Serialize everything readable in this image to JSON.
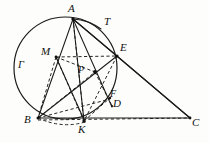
{
  "figure": {
    "background_color": "#fdfdfb",
    "stroke_color": "#1a1a18",
    "dashed_color": "#262624"
  },
  "labels": {
    "A": "A",
    "T": "T",
    "E": "E",
    "M": "M",
    "Gamma": "Γ",
    "P": "P",
    "F": "F",
    "D": "D",
    "B": "B",
    "K": "K",
    "C": "C"
  },
  "label_positions": {
    "A": {
      "x": 68,
      "y": 3
    },
    "T": {
      "x": 104,
      "y": 16
    },
    "E": {
      "x": 120,
      "y": 42
    },
    "M": {
      "x": 41,
      "y": 46
    },
    "Gamma": {
      "x": 18,
      "y": 60
    },
    "P": {
      "x": 78,
      "y": 65
    },
    "F": {
      "x": 110,
      "y": 90
    },
    "D": {
      "x": 113,
      "y": 99
    },
    "B": {
      "x": 24,
      "y": 115
    },
    "K": {
      "x": 78,
      "y": 124
    },
    "C": {
      "x": 192,
      "y": 118
    }
  },
  "points": {
    "A": {
      "x": 73,
      "y": 19
    },
    "T": {
      "x": 99,
      "y": 26
    },
    "E": {
      "x": 117,
      "y": 56
    },
    "M": {
      "x": 56,
      "y": 57
    },
    "P": {
      "x": 95,
      "y": 72
    },
    "F": {
      "x": 109,
      "y": 98
    },
    "D": {
      "x": 112,
      "y": 106
    },
    "B": {
      "x": 38,
      "y": 118
    },
    "K": {
      "x": 84,
      "y": 121
    },
    "C": {
      "x": 190,
      "y": 118
    }
  },
  "circle": {
    "center_x": 65,
    "center_y": 68,
    "radius": 51,
    "name": "Γ"
  },
  "solid_segments": [
    {
      "name": "A-B",
      "from": "A",
      "to": "B"
    },
    {
      "name": "A-K",
      "from": "A",
      "to": "K"
    },
    {
      "name": "A-E",
      "from": "A",
      "to": "E"
    },
    {
      "name": "A-T-C",
      "from": "A",
      "to": "C"
    },
    {
      "name": "B-C",
      "from": "B",
      "to": "C"
    },
    {
      "name": "E-C",
      "from": "E",
      "to": "C"
    },
    {
      "name": "B-E",
      "from": "B",
      "to": "E"
    },
    {
      "name": "M-K",
      "from": "M",
      "to": "K"
    },
    {
      "name": "A-D",
      "from": "A",
      "to": "D"
    }
  ],
  "dashed_segments": [
    {
      "name": "M-E",
      "from": "M",
      "to": "E"
    },
    {
      "name": "M-B",
      "from": "M",
      "to": "B"
    },
    {
      "name": "M-P",
      "from": "M",
      "to": "P"
    },
    {
      "name": "A-P-K",
      "from": "A",
      "to": "K"
    },
    {
      "name": "B-K-C",
      "from": "B",
      "to": "C"
    },
    {
      "name": "B-F",
      "from": "B",
      "to": "F"
    },
    {
      "name": "E-K",
      "from": "E",
      "to": "K"
    },
    {
      "name": "P-D",
      "from": "P",
      "to": "D"
    },
    {
      "name": "B-P",
      "from": "B",
      "to": "P"
    },
    {
      "name": "K-F",
      "from": "K",
      "to": "F"
    }
  ]
}
